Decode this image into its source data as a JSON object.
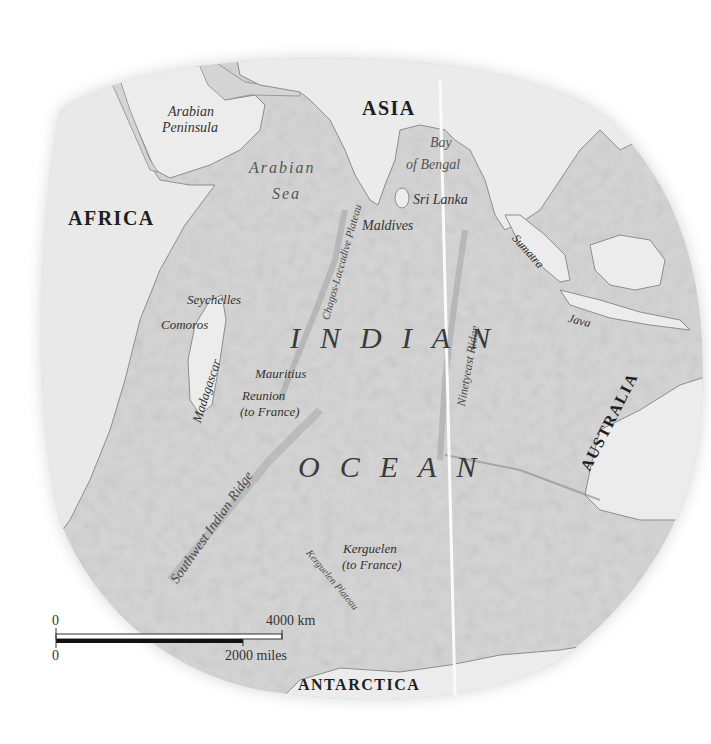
{
  "map": {
    "continents": [
      {
        "id": "africa",
        "label": "AFRICA"
      },
      {
        "id": "asia",
        "label": "ASIA"
      },
      {
        "id": "australia",
        "label": "AUSTRALIA"
      },
      {
        "id": "antarctica",
        "label": "ANTARCTICA"
      }
    ],
    "ocean": {
      "line1": "INDIAN",
      "line2": "OCEAN"
    },
    "seas": {
      "arabian_sea_1": "Arabian",
      "arabian_sea_2": "Sea",
      "bay_of_bengal_1": "Bay",
      "bay_of_bengal_2": "of Bengal"
    },
    "regions": {
      "arabian_peninsula_1": "Arabian",
      "arabian_peninsula_2": "Peninsula"
    },
    "islands": {
      "sri_lanka": "Sri Lanka",
      "maldives": "Maldives",
      "seychelles": "Seychelles",
      "comoros": "Comoros",
      "madagascar": "Madagascar",
      "mauritius": "Mauritius",
      "reunion_1": "Reunion",
      "reunion_2": "(to France)",
      "sumatra": "Sumatra",
      "java": "Java",
      "kerguelen_1": "Kerguelen",
      "kerguelen_2": "(to France)"
    },
    "features": {
      "chagos_laccadive": "Chagos-Laccadive Plateau",
      "ninetyeast_ridge": "Ninetyeast Ridge",
      "southwest_indian_ridge": "Southwest Indian Ridge",
      "kerguelen_plateau": "Kerguelen Plateau"
    },
    "scale": {
      "km_zero": "0",
      "km_max": "4000 km",
      "mi_zero": "0",
      "mi_max": "2000 miles"
    },
    "colors": {
      "ocean_relief": "#d4d4d4",
      "land": "#ececec",
      "coast": "#8a8a8a",
      "text": "#2e2e2e"
    }
  }
}
